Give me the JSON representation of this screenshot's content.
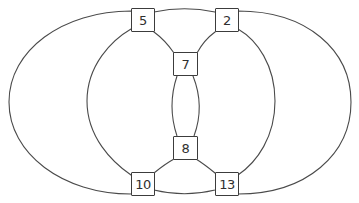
{
  "diagram": {
    "background_color": "#ffffff",
    "stroke_color": "#4a4a4a",
    "box_style": {
      "fill": "#ffffff",
      "border_color": "#3c3c3c",
      "text_color": "#2f2f2f"
    },
    "crossings": [
      {
        "id": "crossing-5",
        "label": "5",
        "x": 131,
        "y": 8,
        "w": 24,
        "h": 24
      },
      {
        "id": "crossing-2",
        "label": "2",
        "x": 215,
        "y": 8,
        "w": 24,
        "h": 24
      },
      {
        "id": "crossing-7",
        "label": "7",
        "x": 173,
        "y": 52,
        "w": 25,
        "h": 24
      },
      {
        "id": "crossing-8",
        "label": "8",
        "x": 173,
        "y": 136,
        "w": 25,
        "h": 24
      },
      {
        "id": "crossing-10",
        "label": "10",
        "x": 131,
        "y": 172,
        "w": 24,
        "h": 24
      },
      {
        "id": "crossing-13",
        "label": "13",
        "x": 215,
        "y": 172,
        "w": 24,
        "h": 24
      }
    ],
    "curves": [
      {
        "name": "left-loop",
        "through_crossings": [
          "5",
          "7",
          "8",
          "10"
        ],
        "path": "M 131 11 C 63 11 9 50 9 102 C 9 154 63 194 131 194 L 154 173 Q 165 164 174 159 L 194 136 Q 205 106 193 76 L 174 53 Q 165 40 154 32 Z"
      },
      {
        "name": "right-loop",
        "through_crossings": [
          "2",
          "7",
          "8",
          "13"
        ],
        "path": "M 238 11 C 307 11 351 50 351 102 C 351 154 307 194 238 194 L 215 173 Q 204 164 196 159 L 177 136 Q 167 106 177 76 L 197 53 Q 204 40 215 32 Z"
      },
      {
        "name": "middle-loop",
        "through_crossings": [
          "5",
          "2",
          "13",
          "10"
        ],
        "path": "M 154 12 Q 184.5 5.5 215 12 L 238 29 C 257 40 275 65 275 101 C 275 137 257 162 238 175 L 215 190 Q 184.5 197.5 154 190 L 131 175 C 112 162 87 137 87 101 C 87 65 112 40 131 29 Z"
      }
    ]
  }
}
